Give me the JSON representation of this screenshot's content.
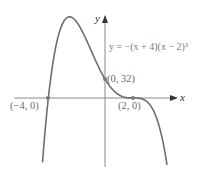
{
  "chart_data": {
    "type": "line",
    "title": "",
    "equation": "y = −(x + 4)(x − 2)³",
    "xlabel": "x",
    "ylabel": "y",
    "grid": false,
    "legend": "none",
    "function": "-(x+4)*(x-2)^3",
    "xlim": [
      -6.5,
      5.1
    ],
    "ylim": [
      -115,
      140
    ],
    "annotated_points": [
      {
        "x": -4,
        "y": 0,
        "label": "(−4, 0)"
      },
      {
        "x": 0,
        "y": 32,
        "label": "(0, 32)"
      },
      {
        "x": 2,
        "y": 0,
        "label": "(2, 0)"
      }
    ],
    "series": [
      {
        "name": "y = −(x + 4)(x − 2)³",
        "x": [
          -4.5,
          -4,
          -3.5,
          -3,
          -2.5,
          -2,
          -1.5,
          -1,
          -0.5,
          0,
          0.5,
          1,
          1.5,
          2,
          2.5,
          3,
          3.5,
          4,
          4.5
        ],
        "values": [
          -76.8,
          0,
          54.5,
          125,
          132.3,
          128,
          104.8,
          81,
          54.7,
          32,
          15.2,
          5,
          0.7,
          0,
          -0.8,
          -7,
          -25.3,
          -64,
          -133.6
        ]
      }
    ]
  },
  "labels": {
    "y_axis": "y",
    "x_axis": "x",
    "equation": "y = −(x + 4)(x − 2)³",
    "point_neg4": "(−4, 0)",
    "point_0_32": "(0, 32)",
    "point_2": "(2, 0)"
  },
  "colors": {
    "curve": "#6e6e6e",
    "axis": "#8a8a8a",
    "point": "#7a7a7a",
    "text": "#6b6b6b"
  }
}
